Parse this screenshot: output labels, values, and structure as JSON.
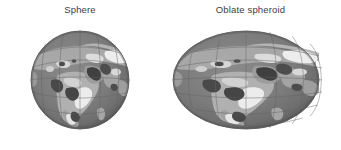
{
  "figure": {
    "background_color": "#ffffff",
    "width": 341,
    "height": 150,
    "caption_color": "#3d3d3d"
  },
  "panels": [
    {
      "id": "sphere",
      "label": "Sphere",
      "shape": "circle",
      "globe_icon": "globe-sphere-icon"
    },
    {
      "id": "oblate",
      "label": "Oblate spheroid",
      "shape": "ellipse",
      "globe_icon": "globe-oblate-spheroid-icon"
    }
  ],
  "colors": {
    "ocean": "#7a7a7a",
    "ocean_shadow": "#5e5e5e",
    "land": "#a8a8a8",
    "land_light": "#c2c2c2",
    "land_highlight": "#ebebeb",
    "land_dark": "#4a4a4a",
    "graticule": "#6a6a6a",
    "outline": "#555555",
    "background": "#ffffff"
  }
}
